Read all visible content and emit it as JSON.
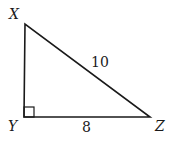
{
  "diagram": {
    "type": "right-triangle",
    "vertices": [
      {
        "name": "X",
        "label": "X"
      },
      {
        "name": "Y",
        "label": "Y"
      },
      {
        "name": "Z",
        "label": "Z"
      }
    ],
    "right_angle_at": "Y",
    "sides": [
      {
        "between": "XZ",
        "label": "10"
      },
      {
        "between": "YZ",
        "label": "8"
      }
    ]
  }
}
